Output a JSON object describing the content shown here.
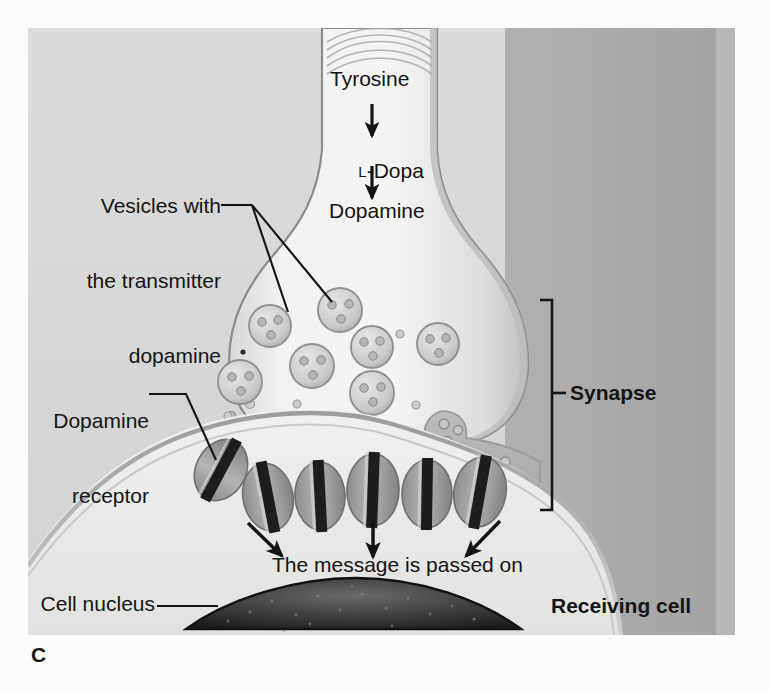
{
  "figure": {
    "panel_letter": "C",
    "title_implied": "Dopamine synapse — neurotransmission",
    "frame": {
      "x": 28,
      "y": 28,
      "width": 707,
      "height": 607
    }
  },
  "labels": {
    "pathway": {
      "step1": "Tyrosine",
      "step2_prefix": "L",
      "step2_rest": "-Dopa",
      "step2_full": "L-Dopa",
      "step3": "Dopamine"
    },
    "vesicles": {
      "line1": "Vesicles with",
      "line2": "the transmitter",
      "line3": "dopamine"
    },
    "receptor": {
      "line1": "Dopamine",
      "line2": "receptor"
    },
    "synapse": "Synapse",
    "message": "The message is passed on",
    "nucleus": "Cell nucleus",
    "receiving_cell": "Receiving cell"
  },
  "colors": {
    "page_background": "#fbfbfa",
    "frame_left_background": "#d9d9d9",
    "frame_right_background": "#a9a9a9",
    "terminal_fill": "#eeeeec",
    "terminal_edge": "#8e8e8e",
    "cleft_fill": "#b4b4b4",
    "receiving_cell_fill": "#ededeb",
    "receptor_body": "#9a9a9a",
    "receptor_slit": "#1d1d1d",
    "nucleus_dark": "#2b2b2b",
    "ink": "#141414"
  },
  "counts": {
    "vesicles": 7,
    "receptors": 6,
    "downstream_arrows": 3,
    "pathway_arrows": 2
  },
  "vesicles": [
    {
      "cx": 270,
      "cy": 326,
      "r": 21
    },
    {
      "cx": 340,
      "cy": 310,
      "r": 22
    },
    {
      "cx": 312,
      "cy": 366,
      "r": 22
    },
    {
      "cx": 240,
      "cy": 382,
      "r": 22
    },
    {
      "cx": 372,
      "cy": 393,
      "r": 22
    },
    {
      "cx": 372,
      "cy": 347,
      "r": 0
    },
    {
      "cx": 438,
      "cy": 344,
      "r": 21
    },
    {
      "cx": 435,
      "cy": 347,
      "r": 0
    }
  ],
  "receptors": [
    {
      "cx": 221,
      "cy": 470,
      "rx": 25,
      "ry": 32,
      "rot": -62
    },
    {
      "cx": 268,
      "cy": 497,
      "rx": 25,
      "ry": 34,
      "rot": -11
    },
    {
      "cx": 320,
      "cy": 496,
      "rx": 25,
      "ry": 34,
      "rot": -3
    },
    {
      "cx": 373,
      "cy": 490,
      "rx": 26,
      "ry": 36,
      "rot": 2
    },
    {
      "cx": 427,
      "cy": 494,
      "rx": 25,
      "ry": 34,
      "rot": 1
    },
    {
      "cx": 480,
      "cy": 492,
      "rx": 26,
      "ry": 35,
      "rot": 10
    }
  ]
}
